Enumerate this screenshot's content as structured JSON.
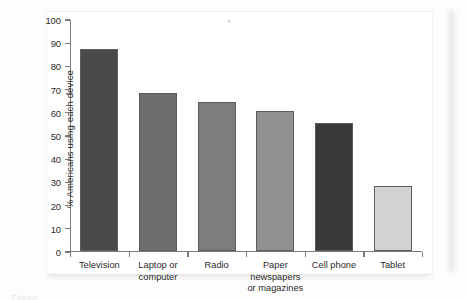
{
  "figure": {
    "background_color": "#ffffff",
    "page_background": "#fdfdfd",
    "caption_fragment": "Figure"
  },
  "chart_data": {
    "type": "bar",
    "title": "",
    "subtitle": "",
    "xlabel": "",
    "ylabel": "% Americans using each device",
    "ylim": [
      0,
      100
    ],
    "ytick_interval": 10,
    "grid": false,
    "legend": false,
    "legend_position": "none",
    "categories": [
      "Television",
      "Laptop or\ncomputer",
      "Radio",
      "Paper\nnewspapers\nor magazines",
      "Cell phone",
      "Tablet"
    ],
    "values": [
      87,
      68,
      64,
      60,
      55,
      28
    ],
    "bar_colors": [
      "#4a4a4a",
      "#6e6e6e",
      "#7d7d7d",
      "#919191",
      "#3a3a3a",
      "#d2d2d2"
    ],
    "bar_edge_color": "#5d5d5d",
    "axis_color": "#7b7b7b",
    "ytick_labels": [
      "0",
      "10",
      "20",
      "30",
      "40",
      "50",
      "60",
      "70",
      "80",
      "90",
      "100"
    ],
    "ytick_values": [
      0,
      10,
      20,
      30,
      40,
      50,
      60,
      70,
      80,
      90,
      100
    ]
  }
}
